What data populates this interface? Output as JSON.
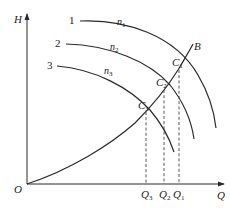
{
  "diagram": {
    "type": "pump performance curves at varying speeds with system curve",
    "axes": {
      "y_label": "H",
      "x_label": "Q",
      "origin_label": "O"
    },
    "pump_curves": [
      {
        "id": "1",
        "label": "1",
        "speed_label": "n",
        "speed_sub": "1"
      },
      {
        "id": "2",
        "label": "2",
        "speed_label": "n",
        "speed_sub": "2"
      },
      {
        "id": "3",
        "label": "3",
        "speed_label": "n",
        "speed_sub": "3"
      }
    ],
    "system_curve": {
      "label": "B"
    },
    "operating_points": [
      {
        "label": "C",
        "sub": "1",
        "flow_label": "Q",
        "flow_sub": "1"
      },
      {
        "label": "C",
        "sub": "2",
        "flow_label": "Q",
        "flow_sub": "2"
      },
      {
        "label": "C",
        "sub": "3",
        "flow_label": "Q",
        "flow_sub": "3"
      }
    ]
  }
}
